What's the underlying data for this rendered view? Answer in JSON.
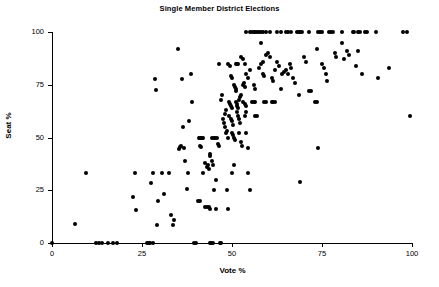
{
  "chart_data": {
    "type": "scatter",
    "title": "Single Member District Elections",
    "xlabel": "Vote %",
    "ylabel": "Seat %",
    "xlim": [
      0,
      100
    ],
    "ylim": [
      0,
      100
    ],
    "xticks": [
      0,
      25,
      50,
      75,
      100
    ],
    "yticks": [
      0,
      25,
      50,
      75,
      100
    ],
    "xticklabels": [
      "0",
      "25",
      "50",
      "75",
      "100"
    ],
    "yticklabels": [
      "0",
      "25",
      "50",
      "75",
      "100"
    ],
    "grid": false,
    "legend": null,
    "marker": "filled-circle",
    "marker_color": "#000000",
    "points": [
      [
        0,
        0
      ],
      [
        6.5,
        9
      ],
      [
        9.5,
        33
      ],
      [
        12.2,
        0
      ],
      [
        13.0,
        0
      ],
      [
        14.0,
        0
      ],
      [
        15.5,
        0
      ],
      [
        17.0,
        0
      ],
      [
        18.0,
        0
      ],
      [
        22.5,
        22
      ],
      [
        23.0,
        33
      ],
      [
        23.3,
        15.5
      ],
      [
        26.5,
        0
      ],
      [
        27.0,
        0
      ],
      [
        27.3,
        0
      ],
      [
        28.0,
        0
      ],
      [
        27.5,
        28.5
      ],
      [
        28.0,
        33
      ],
      [
        28.5,
        77.5
      ],
      [
        29.0,
        72.5
      ],
      [
        29.2,
        8.5
      ],
      [
        29.5,
        20
      ],
      [
        30.5,
        33
      ],
      [
        31.0,
        23
      ],
      [
        32.5,
        33
      ],
      [
        33.0,
        13.5
      ],
      [
        33.5,
        8.5
      ],
      [
        34.0,
        11
      ],
      [
        35.0,
        92
      ],
      [
        35.2,
        44.5
      ],
      [
        35.5,
        45.5
      ],
      [
        35.8,
        46
      ],
      [
        36.0,
        77.5
      ],
      [
        36.5,
        55
      ],
      [
        36.8,
        45
      ],
      [
        37.0,
        39
      ],
      [
        37.5,
        25.5
      ],
      [
        37.8,
        33
      ],
      [
        38.0,
        58
      ],
      [
        38.5,
        80
      ],
      [
        39.0,
        67
      ],
      [
        39.5,
        0
      ],
      [
        40.0,
        0
      ],
      [
        40.5,
        20
      ],
      [
        41.0,
        20
      ],
      [
        40.8,
        50
      ],
      [
        41.2,
        50
      ],
      [
        41.5,
        50
      ],
      [
        41.8,
        50
      ],
      [
        42.0,
        50
      ],
      [
        41.0,
        46
      ],
      [
        41.5,
        45.5
      ],
      [
        42.0,
        33
      ],
      [
        42.5,
        17
      ],
      [
        43.0,
        17
      ],
      [
        43.5,
        17
      ],
      [
        42.5,
        38
      ],
      [
        43.0,
        36
      ],
      [
        43.2,
        37
      ],
      [
        43.5,
        35
      ],
      [
        44.0,
        0
      ],
      [
        44.3,
        0
      ],
      [
        44.8,
        0
      ],
      [
        43.8,
        42
      ],
      [
        44.0,
        41
      ],
      [
        44.5,
        39
      ],
      [
        44.8,
        37
      ],
      [
        44.5,
        50
      ],
      [
        45.0,
        50
      ],
      [
        45.3,
        50
      ],
      [
        45.8,
        50
      ],
      [
        45.0,
        25
      ],
      [
        45.5,
        30
      ],
      [
        46.0,
        47
      ],
      [
        46.3,
        46
      ],
      [
        44.0,
        16
      ],
      [
        45.5,
        16
      ],
      [
        46.8,
        0
      ],
      [
        47.0,
        0
      ],
      [
        46.5,
        85
      ],
      [
        47.0,
        68
      ],
      [
        47.2,
        70
      ],
      [
        47.5,
        59
      ],
      [
        47.8,
        57
      ],
      [
        48.0,
        61
      ],
      [
        48.2,
        63
      ],
      [
        48.0,
        55
      ],
      [
        48.3,
        52
      ],
      [
        48.5,
        53
      ],
      [
        48.8,
        50
      ],
      [
        48.5,
        25
      ],
      [
        49.0,
        16
      ],
      [
        49.0,
        85
      ],
      [
        49.5,
        84
      ],
      [
        49.8,
        79
      ],
      [
        50.0,
        78
      ],
      [
        49.2,
        67
      ],
      [
        49.5,
        66
      ],
      [
        49.8,
        65
      ],
      [
        50.0,
        64
      ],
      [
        49.3,
        60
      ],
      [
        49.6,
        59
      ],
      [
        50.0,
        58
      ],
      [
        50.2,
        56
      ],
      [
        50.0,
        52
      ],
      [
        50.3,
        51
      ],
      [
        50.5,
        50
      ],
      [
        50.8,
        49
      ],
      [
        50.0,
        33
      ],
      [
        50.5,
        37
      ],
      [
        50.5,
        75
      ],
      [
        50.8,
        74
      ],
      [
        51.0,
        73
      ],
      [
        51.2,
        72
      ],
      [
        51.0,
        85
      ],
      [
        51.5,
        85
      ],
      [
        51.8,
        85
      ],
      [
        51.0,
        67
      ],
      [
        51.3,
        66
      ],
      [
        51.5,
        65
      ],
      [
        51.8,
        64
      ],
      [
        51.5,
        62
      ],
      [
        51.8,
        60
      ],
      [
        52.0,
        59
      ],
      [
        52.2,
        57
      ],
      [
        52.0,
        68
      ],
      [
        52.3,
        69
      ],
      [
        52.5,
        70
      ],
      [
        52.0,
        52
      ],
      [
        52.5,
        48
      ],
      [
        52.8,
        46
      ],
      [
        52.5,
        88
      ],
      [
        53.0,
        87
      ],
      [
        53.5,
        85
      ],
      [
        53.0,
        75
      ],
      [
        53.3,
        76
      ],
      [
        53.5,
        74
      ],
      [
        53.0,
        67
      ],
      [
        53.5,
        66
      ],
      [
        53.8,
        65
      ],
      [
        53.5,
        60
      ],
      [
        54.0,
        62
      ],
      [
        54.0,
        52
      ],
      [
        54.5,
        45
      ],
      [
        54.5,
        33
      ],
      [
        55.0,
        25
      ],
      [
        54.0,
        80
      ],
      [
        54.5,
        78
      ],
      [
        55.0,
        82
      ],
      [
        55.5,
        67
      ],
      [
        56.0,
        67
      ],
      [
        56.5,
        67
      ],
      [
        56.0,
        75
      ],
      [
        56.5,
        73
      ],
      [
        56.5,
        60
      ],
      [
        57.0,
        60
      ],
      [
        57.5,
        83
      ],
      [
        58.0,
        85
      ],
      [
        58.5,
        86
      ],
      [
        58.0,
        95
      ],
      [
        58.5,
        80
      ],
      [
        59.0,
        79
      ],
      [
        59.0,
        67
      ],
      [
        59.5,
        67
      ],
      [
        59.5,
        89
      ],
      [
        60.0,
        90
      ],
      [
        60.5,
        88
      ],
      [
        61.0,
        67
      ],
      [
        61.5,
        67
      ],
      [
        62.0,
        67
      ],
      [
        61.0,
        78
      ],
      [
        61.5,
        77
      ],
      [
        62.0,
        82
      ],
      [
        62.5,
        86
      ],
      [
        63.0,
        84
      ],
      [
        63.5,
        73
      ],
      [
        64.0,
        80
      ],
      [
        64.5,
        81
      ],
      [
        65.0,
        82
      ],
      [
        65.5,
        80
      ],
      [
        66.0,
        85
      ],
      [
        66.5,
        83
      ],
      [
        67.0,
        78
      ],
      [
        67.5,
        76
      ],
      [
        68.5,
        70
      ],
      [
        69.0,
        29
      ],
      [
        70.0,
        88
      ],
      [
        70.5,
        86
      ],
      [
        71.5,
        72
      ],
      [
        72.0,
        72
      ],
      [
        73.0,
        67
      ],
      [
        73.5,
        67
      ],
      [
        73.5,
        92
      ],
      [
        74.0,
        45
      ],
      [
        75.0,
        85
      ],
      [
        75.5,
        83
      ],
      [
        76.0,
        80
      ],
      [
        76.5,
        77
      ],
      [
        78.5,
        90
      ],
      [
        79.0,
        88
      ],
      [
        80.5,
        95
      ],
      [
        81.0,
        87
      ],
      [
        82.0,
        91
      ],
      [
        82.5,
        89
      ],
      [
        84.5,
        84
      ],
      [
        85.0,
        91
      ],
      [
        86.0,
        80
      ],
      [
        90.5,
        78
      ],
      [
        93.5,
        83
      ],
      [
        99.5,
        60
      ],
      [
        54.0,
        100
      ],
      [
        55.0,
        100
      ],
      [
        55.5,
        100
      ],
      [
        56.0,
        100
      ],
      [
        56.5,
        100
      ],
      [
        57.0,
        100
      ],
      [
        57.5,
        100
      ],
      [
        58.0,
        100
      ],
      [
        58.5,
        100
      ],
      [
        59.5,
        100
      ],
      [
        60.5,
        100
      ],
      [
        62.5,
        100
      ],
      [
        63.5,
        100
      ],
      [
        65.0,
        100
      ],
      [
        65.5,
        100
      ],
      [
        66.5,
        100
      ],
      [
        68.0,
        100
      ],
      [
        68.5,
        100
      ],
      [
        69.0,
        100
      ],
      [
        69.5,
        100
      ],
      [
        71.5,
        100
      ],
      [
        74.0,
        100
      ],
      [
        74.5,
        100
      ],
      [
        75.0,
        100
      ],
      [
        77.0,
        100
      ],
      [
        77.5,
        100
      ],
      [
        78.0,
        100
      ],
      [
        80.5,
        100
      ],
      [
        83.5,
        100
      ],
      [
        84.0,
        100
      ],
      [
        85.0,
        100
      ],
      [
        85.5,
        100
      ],
      [
        87.0,
        100
      ],
      [
        87.5,
        100
      ],
      [
        90.0,
        100
      ],
      [
        97.5,
        100
      ],
      [
        98.5,
        100
      ]
    ]
  }
}
